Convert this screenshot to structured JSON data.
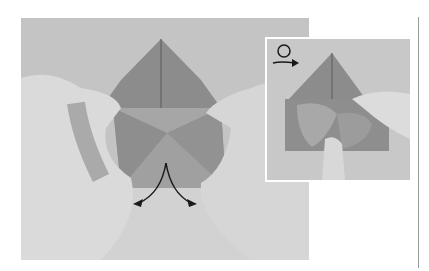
{
  "figure": {
    "main_photo": {
      "subject": "hands folding origami model",
      "annotation_icon": "split-arrows-down-icon"
    },
    "inset_photo": {
      "subject": "close-up of pressing fold with finger",
      "annotation_icon": "turn-over-loop-arrow-icon"
    },
    "colors": {
      "background": "#c4c4c4",
      "paper": "#8a8a8a",
      "skin": "#d9d9d9",
      "arrow": "#1a1a1a",
      "rule": "#9a9a9a"
    }
  }
}
